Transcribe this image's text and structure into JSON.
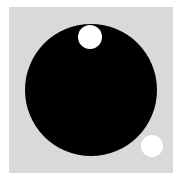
{
  "scene": {
    "background_color": "#ffffff",
    "panel": {
      "color": "#d9d9d9",
      "x": 9,
      "y": 7,
      "width": 164,
      "height": 166
    },
    "shapes": [
      {
        "name": "large-black-disc",
        "color": "#000000",
        "cx": 91,
        "cy": 90,
        "r": 66
      },
      {
        "name": "top-white-disc",
        "color": "#ffffff",
        "cx": 90,
        "cy": 37,
        "r": 12
      },
      {
        "name": "bottom-right-white-disc",
        "color": "#ffffff",
        "cx": 152,
        "cy": 146,
        "r": 11
      }
    ]
  }
}
